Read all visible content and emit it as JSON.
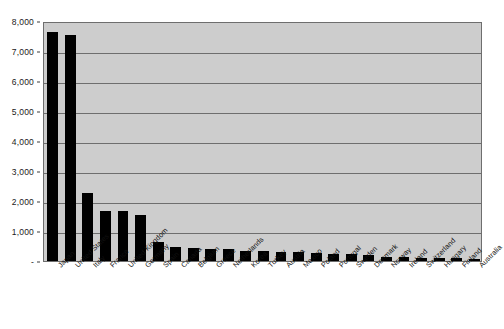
{
  "chart_data": {
    "type": "bar",
    "title": "",
    "xlabel": "",
    "ylabel": "",
    "ylim": [
      0,
      8000
    ],
    "grid": true,
    "legend": "none",
    "yticks": [
      {
        "value": 8000,
        "label": "8,000"
      },
      {
        "value": 7000,
        "label": "7,000"
      },
      {
        "value": 6000,
        "label": "6,000"
      },
      {
        "value": 5000,
        "label": "5,000"
      },
      {
        "value": 4000,
        "label": "4,000"
      },
      {
        "value": 3000,
        "label": "3,000"
      },
      {
        "value": 2000,
        "label": "2,000"
      },
      {
        "value": 1000,
        "label": "1,000"
      },
      {
        "value": 0,
        "label": "-"
      }
    ],
    "categories": [
      "Japan",
      "United States",
      "Italy",
      "France",
      "United Kingdom",
      "Germany",
      "Spain",
      "Canada",
      "Belgium",
      "Greece",
      "Netherlands",
      "Korea",
      "Turkey",
      "Austria",
      "Mexico",
      "Poland",
      "Portugal",
      "Sweden",
      "Denmark",
      "Norway",
      "Ireland",
      "Switzerland",
      "Hungary",
      "Finland",
      "Australia"
    ],
    "values": [
      7620,
      7540,
      2270,
      1670,
      1660,
      1540,
      630,
      470,
      430,
      400,
      395,
      350,
      330,
      310,
      290,
      270,
      250,
      230,
      190,
      140,
      120,
      110,
      95,
      85,
      70
    ],
    "bar_color": "#000000",
    "plot_background": "#cdcdcd",
    "gridline_color": "#6e6e6e",
    "axis_color": "#3d3d3d"
  }
}
